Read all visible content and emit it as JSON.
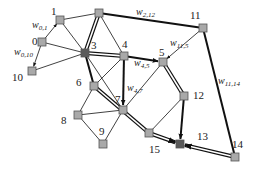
{
  "diagram": {
    "type": "network-graph",
    "nodes": [
      {
        "id": "0",
        "label": "0",
        "x": 42,
        "y": 42,
        "lx": 32,
        "ly": 45,
        "dark": false
      },
      {
        "id": "1",
        "label": "1",
        "x": 60,
        "y": 20,
        "lx": 51,
        "ly": 15,
        "dark": false
      },
      {
        "id": "2",
        "label": "",
        "x": 99,
        "y": 13,
        "lx": 0,
        "ly": 0,
        "dark": false
      },
      {
        "id": "3",
        "label": "3",
        "x": 85,
        "y": 53,
        "lx": 91,
        "ly": 49,
        "dark": true
      },
      {
        "id": "4",
        "label": "4",
        "x": 124,
        "y": 56,
        "lx": 122,
        "ly": 48,
        "dark": false
      },
      {
        "id": "5",
        "label": "5",
        "x": 163,
        "y": 62,
        "lx": 159,
        "ly": 56,
        "dark": false
      },
      {
        "id": "6",
        "label": "6",
        "x": 94,
        "y": 86,
        "lx": 76,
        "ly": 86,
        "dark": false
      },
      {
        "id": "7",
        "label": "7",
        "x": 123,
        "y": 110,
        "lx": 115,
        "ly": 103,
        "dark": false
      },
      {
        "id": "8",
        "label": "8",
        "x": 78,
        "y": 115,
        "lx": 61,
        "ly": 124,
        "dark": false
      },
      {
        "id": "9",
        "label": "9",
        "x": 103,
        "y": 144,
        "lx": 99,
        "ly": 135,
        "dark": false
      },
      {
        "id": "10",
        "label": "10",
        "x": 32,
        "y": 71,
        "lx": 12,
        "ly": 81,
        "dark": false
      },
      {
        "id": "11",
        "label": "11",
        "x": 203,
        "y": 28,
        "lx": 190,
        "ly": 19,
        "dark": false
      },
      {
        "id": "12",
        "label": "12",
        "x": 184,
        "y": 96,
        "lx": 193,
        "ly": 99,
        "dark": false
      },
      {
        "id": "13",
        "label": "13",
        "x": 180,
        "y": 144,
        "lx": 197,
        "ly": 140,
        "dark": true
      },
      {
        "id": "14",
        "label": "14",
        "x": 235,
        "y": 157,
        "lx": 232,
        "ly": 148,
        "dark": false
      },
      {
        "id": "15",
        "label": "15",
        "x": 149,
        "y": 133,
        "lx": 149,
        "ly": 153,
        "dark": false
      }
    ],
    "edges": [
      {
        "from": "0",
        "to": "1",
        "style": "thin-arrow",
        "weight_label": "w",
        "weight_sub": "0,1"
      },
      {
        "from": "0",
        "to": "10",
        "style": "thin-arrow",
        "weight_label": "w",
        "weight_sub": "0,10"
      },
      {
        "from": "0",
        "to": "3",
        "style": "thin"
      },
      {
        "from": "1",
        "to": "2",
        "style": "thin"
      },
      {
        "from": "1",
        "to": "3",
        "style": "thin"
      },
      {
        "from": "10",
        "to": "3",
        "style": "thin"
      },
      {
        "from": "2",
        "to": "11",
        "style": "thick",
        "weight_label": "w",
        "weight_sub": "2,12"
      },
      {
        "from": "2",
        "to": "3",
        "style": "double"
      },
      {
        "from": "2",
        "to": "4",
        "style": "thin"
      },
      {
        "from": "3",
        "to": "4",
        "style": "double"
      },
      {
        "from": "3",
        "to": "6",
        "style": "thick"
      },
      {
        "from": "3",
        "to": "7",
        "style": "thin"
      },
      {
        "from": "4",
        "to": "5",
        "style": "thick-arrow",
        "weight_label": "w",
        "weight_sub": "4,5"
      },
      {
        "from": "4",
        "to": "7",
        "style": "thick-arrow",
        "weight_label": "w",
        "weight_sub": "4,7"
      },
      {
        "from": "4",
        "to": "6",
        "style": "thin"
      },
      {
        "from": "11",
        "to": "5",
        "style": "thin-arrow",
        "weight_label": "w",
        "weight_sub": "11,5"
      },
      {
        "from": "11",
        "to": "14",
        "style": "thick",
        "weight_label": "w",
        "weight_sub": "11,14"
      },
      {
        "from": "5",
        "to": "12",
        "style": "double"
      },
      {
        "from": "5",
        "to": "7",
        "style": "thin"
      },
      {
        "from": "6",
        "to": "15",
        "style": "double"
      },
      {
        "from": "6",
        "to": "8",
        "style": "thin"
      },
      {
        "from": "8",
        "to": "7",
        "style": "thin"
      },
      {
        "from": "8",
        "to": "9",
        "style": "thin"
      },
      {
        "from": "9",
        "to": "7",
        "style": "thin"
      },
      {
        "from": "12",
        "to": "13",
        "style": "thick-arrow"
      },
      {
        "from": "12",
        "to": "15",
        "style": "thin"
      },
      {
        "from": "15",
        "to": "13",
        "style": "double-arrow"
      },
      {
        "from": "14",
        "to": "13",
        "style": "double-arrow"
      }
    ],
    "weight_labels": [
      {
        "text": "w",
        "sub": "0,1",
        "x": 32,
        "y": 28
      },
      {
        "text": "w",
        "sub": "0,10",
        "x": 14,
        "y": 55
      },
      {
        "text": "w",
        "sub": "2,12",
        "x": 136,
        "y": 15
      },
      {
        "text": "w",
        "sub": "11,5",
        "x": 170,
        "y": 46
      },
      {
        "text": "w",
        "sub": "4,5",
        "x": 134,
        "y": 66
      },
      {
        "text": "w",
        "sub": "4,7",
        "x": 127,
        "y": 91
      },
      {
        "text": "w",
        "sub": "11,14",
        "x": 218,
        "y": 84
      }
    ],
    "colors": {
      "node_fill": "#a9a9a9",
      "node_fill_dark": "#5a5a5a",
      "node_stroke": "#555555",
      "edge": "#111111",
      "background": "#ffffff"
    }
  }
}
